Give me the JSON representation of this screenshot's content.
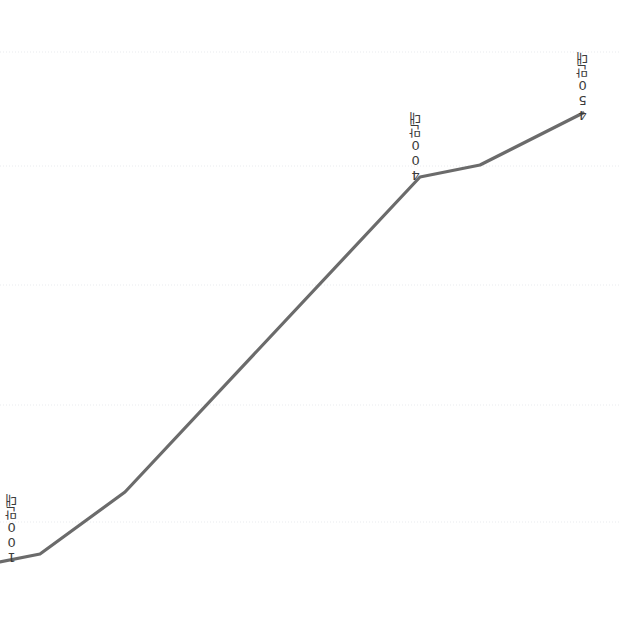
{
  "chart_data": {
    "type": "line",
    "title": "",
    "subtitle": "",
    "xlabel": "",
    "ylabel": "",
    "grid": true,
    "legend": "none",
    "xlim": [
      0,
      619
    ],
    "ylim": [
      0,
      624
    ],
    "axis_visible": false,
    "tick_labels_x": [],
    "tick_labels_y": [],
    "gridlines_y_px": [
      52,
      166,
      285,
      405,
      522
    ],
    "series": [
      {
        "name": "판매량",
        "color": "#6b6b6b",
        "line_width": 3.2,
        "points_px": [
          [
            0,
            562
          ],
          [
            40,
            554
          ],
          [
            125,
            492
          ],
          [
            420,
            177
          ],
          [
            480,
            165
          ],
          [
            583,
            113
          ]
        ],
        "values": [
          100,
          110,
          185,
          400,
          415,
          450
        ],
        "unit": "만대"
      }
    ],
    "annotations": [
      {
        "id": "label-start",
        "text": "100만대",
        "value": 100,
        "anchor_px": [
          0,
          562
        ],
        "label_px": [
          5,
          494
        ],
        "rotation": "vertical-upright"
      },
      {
        "id": "label-mid",
        "text": "400만대",
        "value": 400,
        "anchor_px": [
          420,
          177
        ],
        "label_px": [
          409,
          112
        ],
        "rotation": "vertical-upright"
      },
      {
        "id": "label-end",
        "text": "450만대",
        "value": 450,
        "anchor_px": [
          583,
          113
        ],
        "label_px": [
          576,
          52
        ],
        "rotation": "vertical-upright"
      }
    ],
    "colors": {
      "line": "#6b6b6b",
      "grid": "#e9ebee",
      "label_text": "#3b3b3b",
      "background": "#ffffff"
    }
  }
}
